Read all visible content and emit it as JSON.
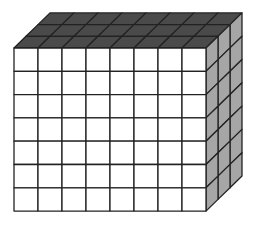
{
  "diagram": {
    "type": "rectangular-prism-of-unit-cubes",
    "dimensions": {
      "columns": 8,
      "rows": 7,
      "depth": 3
    },
    "colors": {
      "front": "#ffffff",
      "top": "#4a4a4a",
      "side": "#a6a6a6",
      "line": "#222222"
    },
    "geometry": {
      "front_origin": [
        14,
        48
      ],
      "cell_width": 24,
      "cell_height": 23.3,
      "depth_step": [
        12,
        -11.7
      ]
    }
  }
}
